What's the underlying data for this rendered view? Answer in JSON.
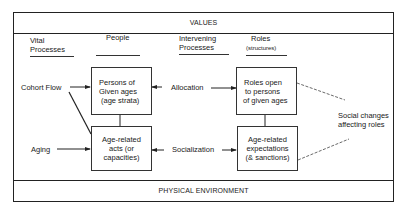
{
  "bands": {
    "top": "VALUES",
    "bottom": "PHYSICAL ENVIRONMENT"
  },
  "column_headers": {
    "vital": [
      "Vital",
      "Processes"
    ],
    "people": "People",
    "intervening": [
      "Intervening",
      "Processes"
    ],
    "roles": [
      "Roles",
      "(structures)"
    ]
  },
  "boxes": {
    "persons": [
      "Persons of",
      "Given ages",
      "(age strata)"
    ],
    "acts": [
      "Age-related",
      "acts (or",
      "capacities)"
    ],
    "roles_open": [
      "Roles open",
      "to persons",
      "of given ages"
    ],
    "expectations": [
      "Age-related",
      "expectations",
      "(& sanctions)"
    ]
  },
  "labels": {
    "cohort_flow": "Cohort Flow",
    "aging": "Aging",
    "allocation": "Allocation",
    "socialization": "Socialization",
    "social_changes": [
      "Social changes",
      "affecting roles"
    ]
  }
}
